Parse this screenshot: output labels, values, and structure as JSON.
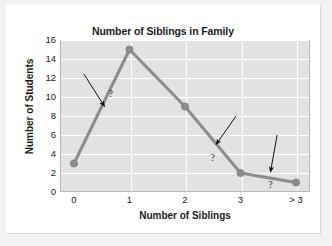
{
  "chart_data": {
    "type": "line",
    "title": "Number of Siblings in Family",
    "xlabel": "Number of Siblings",
    "ylabel": "Number of Students",
    "categories": [
      "0",
      "1",
      "2",
      "3",
      "> 3"
    ],
    "values": [
      3,
      15,
      9,
      2,
      1
    ],
    "ylim": [
      0,
      16
    ],
    "yticks": [
      "0",
      "2",
      "4",
      "6",
      "8",
      "10",
      "12",
      "14",
      "16"
    ],
    "ytick_values": [
      0,
      2,
      4,
      6,
      8,
      10,
      12,
      14,
      16
    ],
    "grid": true,
    "legend": "none",
    "series_color": "#8c8c8c",
    "marker_color": "#8c8c8c",
    "plot_background": "#e2e2e2",
    "gridline_color": "#ffffff",
    "annotations": [
      {
        "label": "?",
        "target_x": 0.55,
        "target_y": 9.0,
        "tail_x": 0.18,
        "tail_y": 12.4,
        "label_x": 0.66,
        "label_y": 10.4
      },
      {
        "label": "?",
        "target_x": 2.56,
        "target_y": 5.0,
        "tail_x": 2.92,
        "tail_y": 8.0,
        "label_x": 2.5,
        "label_y": 3.7
      },
      {
        "label": "?",
        "target_x": 3.54,
        "target_y": 2.1,
        "tail_x": 3.66,
        "tail_y": 6.0,
        "label_x": 3.54,
        "label_y": 0.85
      }
    ]
  }
}
